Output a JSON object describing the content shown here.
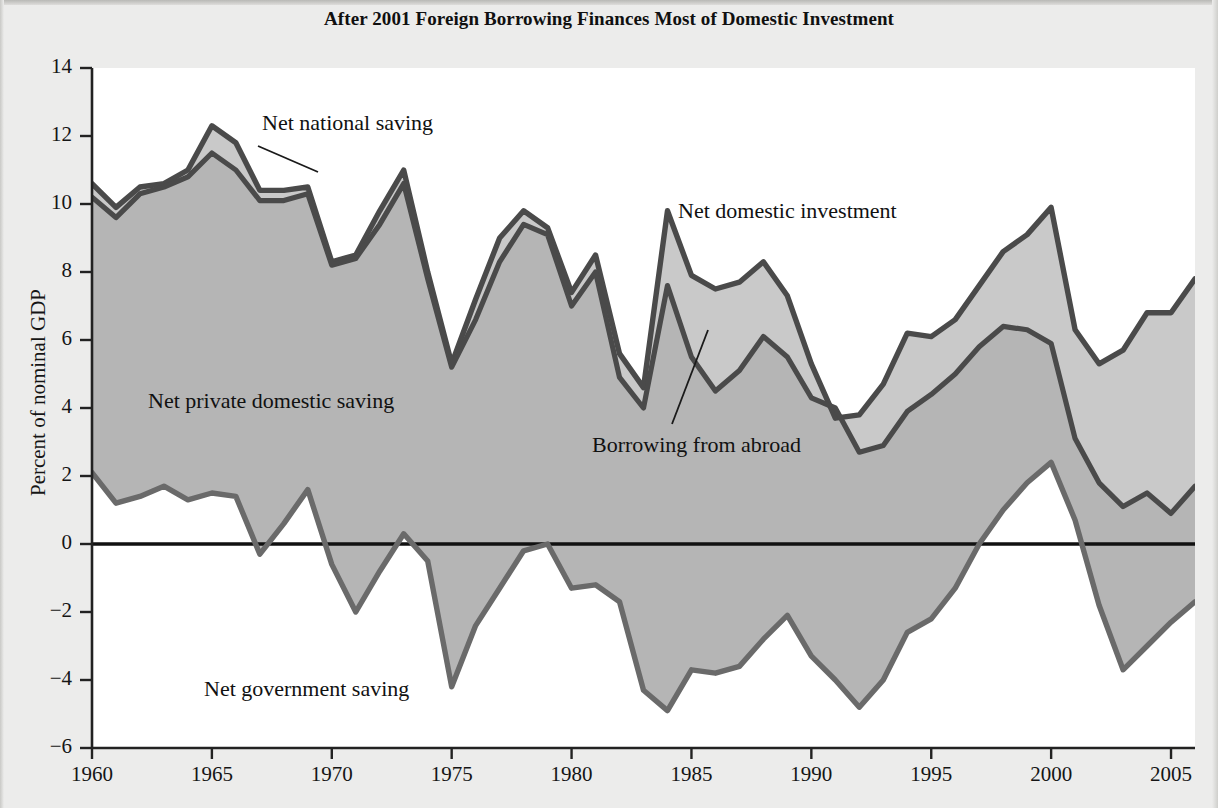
{
  "figure": {
    "title": "After 2001 Foreign Borrowing Finances Most of Domestic Investment",
    "ylabel": "Percent of nominal GDP"
  },
  "annotations": {
    "net_national_saving": "Net national saving",
    "net_domestic_investment": "Net domestic investment",
    "net_private_domestic_saving": "Net private domestic saving",
    "borrowing_from_abroad": "Borrowing from abroad",
    "net_government_saving": "Net government saving"
  },
  "colors": {
    "line": "#4a4a4a",
    "fill_upper": "#c9c9c9",
    "fill_lower": "#b5b5b5",
    "zero_line": "#111111",
    "axis": "#222222",
    "page_background": "#ececeb",
    "plot_background": "#ffffff"
  },
  "chart_data": {
    "type": "area",
    "title": "After 2001 Foreign Borrowing Finances Most of Domestic Investment",
    "xlabel": "",
    "ylabel": "Percent of nominal GDP",
    "xlim": [
      1960,
      2006
    ],
    "ylim": [
      -6,
      14
    ],
    "ytick_labels": [
      "14",
      "12",
      "10",
      "8",
      "6",
      "4",
      "2",
      "0",
      "−2",
      "−4",
      "−6"
    ],
    "yticks": [
      14,
      12,
      10,
      8,
      6,
      4,
      2,
      0,
      -2,
      -4,
      -6
    ],
    "xticks": [
      1960,
      1965,
      1970,
      1975,
      1980,
      1985,
      1990,
      1995,
      2000,
      2005
    ],
    "xtick_labels": [
      "1960",
      "1965",
      "1970",
      "1975",
      "1980",
      "1985",
      "1990",
      "1995",
      "2000",
      "2005"
    ],
    "grid": false,
    "legend": "inline-annotations",
    "x": [
      1960,
      1961,
      1962,
      1963,
      1964,
      1965,
      1966,
      1967,
      1968,
      1969,
      1970,
      1971,
      1972,
      1973,
      1974,
      1975,
      1976,
      1977,
      1978,
      1979,
      1980,
      1981,
      1982,
      1983,
      1984,
      1985,
      1986,
      1987,
      1988,
      1989,
      1990,
      1991,
      1992,
      1993,
      1994,
      1995,
      1996,
      1997,
      1998,
      1999,
      2000,
      2001,
      2002,
      2003,
      2004,
      2005,
      2006
    ],
    "series": [
      {
        "name": "Net domestic investment",
        "values": [
          10.6,
          9.9,
          10.5,
          10.6,
          11.0,
          12.3,
          11.8,
          10.4,
          10.4,
          10.5,
          8.3,
          8.5,
          9.8,
          11.0,
          8.0,
          5.3,
          7.2,
          9.0,
          9.8,
          9.3,
          7.4,
          8.5,
          5.6,
          4.6,
          9.8,
          7.9,
          7.5,
          7.7,
          8.3,
          7.3,
          5.3,
          3.7,
          3.8,
          4.7,
          6.2,
          6.1,
          6.6,
          7.6,
          8.6,
          9.1,
          9.9,
          6.3,
          5.3,
          5.7,
          6.8,
          6.8,
          7.8
        ]
      },
      {
        "name": "Net national saving",
        "values": [
          10.2,
          9.6,
          10.3,
          10.5,
          10.8,
          11.5,
          11.0,
          10.1,
          10.1,
          10.3,
          8.2,
          8.4,
          9.4,
          10.6,
          7.8,
          5.2,
          6.6,
          8.3,
          9.4,
          9.1,
          7.0,
          8.0,
          4.9,
          4.0,
          7.6,
          5.5,
          4.5,
          5.1,
          6.1,
          5.5,
          4.3,
          4.0,
          2.7,
          2.9,
          3.9,
          4.4,
          5.0,
          5.8,
          6.4,
          6.3,
          5.9,
          3.1,
          1.8,
          1.1,
          1.5,
          0.9,
          1.7
        ]
      },
      {
        "name": "Net government saving",
        "values": [
          2.1,
          1.2,
          1.4,
          1.7,
          1.3,
          1.5,
          1.4,
          -0.3,
          0.6,
          1.6,
          -0.6,
          -2.0,
          -0.8,
          0.3,
          -0.5,
          -4.2,
          -2.4,
          -1.3,
          -0.2,
          0.0,
          -1.3,
          -1.2,
          -1.7,
          -4.3,
          -4.9,
          -3.7,
          -3.8,
          -3.6,
          -2.8,
          -2.1,
          -3.3,
          -4.0,
          -4.8,
          -4.0,
          -2.6,
          -2.2,
          -1.3,
          0.0,
          1.0,
          1.8,
          2.4,
          0.7,
          -1.8,
          -3.7,
          -3.0,
          -2.3,
          -1.7
        ]
      }
    ],
    "bands": [
      {
        "name": "Net private domestic saving",
        "between": [
          "Net government saving",
          "Net national saving"
        ],
        "shade": "#b5b5b5"
      },
      {
        "name": "Borrowing from abroad",
        "between": [
          "Net national saving",
          "Net domestic investment"
        ],
        "shade": "#c9c9c9"
      }
    ]
  }
}
